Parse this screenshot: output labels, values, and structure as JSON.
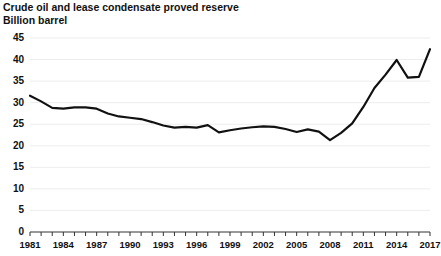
{
  "chart_data": {
    "type": "line",
    "title": "Crude oil and lease condensate proved reserve",
    "subtitle": "Billion barrel",
    "xlabel": "",
    "ylabel": "Billion barrel",
    "ylim": [
      0,
      45
    ],
    "xlim": [
      1981,
      2017
    ],
    "ytick_step": 5,
    "xtick_step": 1,
    "xlabel_step": 3,
    "grid": true,
    "grid_axis": "y",
    "legend": false,
    "line_color": "#111111",
    "line_width": 2.2,
    "yticks": [
      0,
      5,
      10,
      15,
      20,
      25,
      30,
      35,
      40,
      45
    ],
    "ytick_labels": [
      "0",
      "5",
      "10",
      "15",
      "20",
      "25",
      "30",
      "35",
      "40",
      "45"
    ],
    "xtick_labels": [
      "1981",
      "1984",
      "1987",
      "1990",
      "1993",
      "1996",
      "1999",
      "2002",
      "2005",
      "2008",
      "2011",
      "2014",
      "2017"
    ],
    "series": [
      {
        "name": "Crude oil and lease condensate proved reserve",
        "x": [
          1981,
          1982,
          1983,
          1984,
          1985,
          1986,
          1987,
          1988,
          1989,
          1990,
          1991,
          1992,
          1993,
          1994,
          1995,
          1996,
          1997,
          1998,
          1999,
          2000,
          2001,
          2002,
          2003,
          2004,
          2005,
          2006,
          2007,
          2008,
          2009,
          2010,
          2011,
          2012,
          2013,
          2014,
          2015,
          2016,
          2017
        ],
        "values": [
          31.6,
          30.3,
          28.8,
          28.6,
          28.9,
          28.9,
          28.6,
          27.5,
          26.8,
          26.5,
          26.2,
          25.5,
          24.7,
          24.2,
          24.4,
          24.2,
          24.8,
          23.1,
          23.6,
          24.0,
          24.3,
          24.5,
          24.4,
          23.9,
          23.2,
          23.8,
          23.3,
          21.3,
          23.0,
          25.2,
          29.0,
          33.4,
          36.5,
          39.9,
          35.8,
          36.0,
          42.4
        ],
        "value_axis_units": "Billion barrels"
      }
    ]
  }
}
